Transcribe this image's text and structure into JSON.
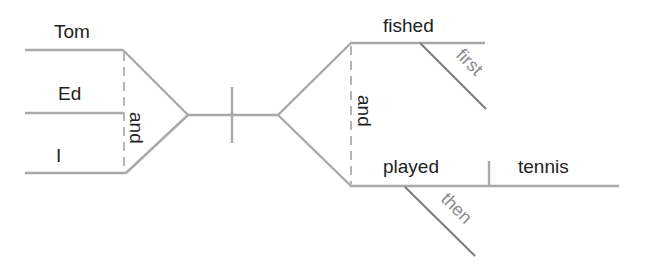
{
  "diagram": {
    "type": "sentence-diagram",
    "subjects": [
      {
        "word": "Tom"
      },
      {
        "word": "Ed"
      },
      {
        "word": "I"
      }
    ],
    "subject_conjunction": "and",
    "predicates": [
      {
        "verb": "fished",
        "modifier": "first"
      },
      {
        "verb": "played",
        "modifier": "then",
        "object": "tennis"
      }
    ],
    "predicate_conjunction": "and"
  },
  "colors": {
    "line": "#a9a9a9",
    "modifier_line": "#7a7a7a",
    "text": "#222222",
    "modifier_text": "#8a8a8a"
  }
}
